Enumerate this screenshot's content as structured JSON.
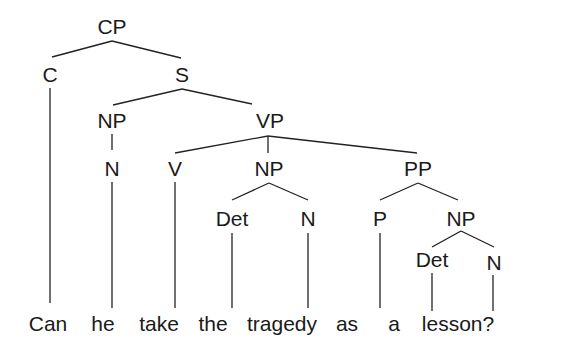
{
  "diagram": {
    "type": "syntax-tree",
    "nodes": {
      "cp": {
        "label": "CP"
      },
      "c": {
        "label": "C"
      },
      "s": {
        "label": "S"
      },
      "np_subj": {
        "label": "NP"
      },
      "n_subj": {
        "label": "N"
      },
      "vp": {
        "label": "VP"
      },
      "v": {
        "label": "V"
      },
      "np_obj": {
        "label": "NP"
      },
      "det_obj": {
        "label": "Det"
      },
      "n_obj": {
        "label": "N"
      },
      "pp": {
        "label": "PP"
      },
      "p": {
        "label": "P"
      },
      "np_pp": {
        "label": "NP"
      },
      "det_pp": {
        "label": "Det"
      },
      "n_pp": {
        "label": "N"
      }
    },
    "words": [
      "Can",
      "he",
      "take",
      "the",
      "tragedy",
      "as",
      "a",
      "lesson?"
    ],
    "edges": [
      [
        "CP",
        "C"
      ],
      [
        "CP",
        "S"
      ],
      [
        "S",
        "NP"
      ],
      [
        "S",
        "VP"
      ],
      [
        "NP",
        "N"
      ],
      [
        "VP",
        "V"
      ],
      [
        "VP",
        "NP"
      ],
      [
        "VP",
        "PP"
      ],
      [
        "NP",
        "Det"
      ],
      [
        "NP",
        "N"
      ],
      [
        "PP",
        "P"
      ],
      [
        "PP",
        "NP"
      ],
      [
        "NP",
        "Det"
      ],
      [
        "NP",
        "N"
      ],
      [
        "C",
        "Can"
      ],
      [
        "N",
        "he"
      ],
      [
        "V",
        "take"
      ],
      [
        "Det",
        "the"
      ],
      [
        "N",
        "tragedy"
      ],
      [
        "P",
        "as"
      ],
      [
        "Det",
        "a"
      ],
      [
        "N",
        "lesson?"
      ]
    ]
  }
}
